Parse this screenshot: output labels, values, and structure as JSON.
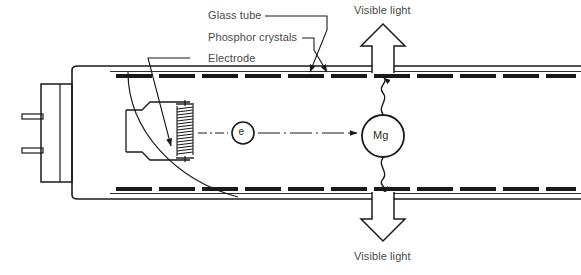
{
  "diagram": {
    "background_color": "#ffffff",
    "line_color": "#1a1a1a",
    "text_color": "#4a4a4a"
  },
  "labels": {
    "glass_tube": "Glass tube",
    "phosphor_crystals": "Phosphor crystals",
    "electrode": "Electrode",
    "visible_light_top": "Visible light",
    "visible_light_bottom": "Visible light"
  },
  "particles": {
    "electron_symbol": "e",
    "mercury_symbol": "Mg"
  },
  "components": {
    "tube_name": "glass-tube-body",
    "base_cap_name": "tube-base-cap",
    "pin_count": 2,
    "filament_name": "electrode-filament-coil",
    "phosphor_layer_top": "phosphor-layer-top",
    "phosphor_layer_bottom": "phosphor-layer-bottom",
    "cutaway_name": "cutaway-arc",
    "uv_photon_up": "uv-photon-wave-up",
    "uv_photon_down": "uv-photon-wave-down",
    "electron_path": "electron-path-arrow"
  }
}
